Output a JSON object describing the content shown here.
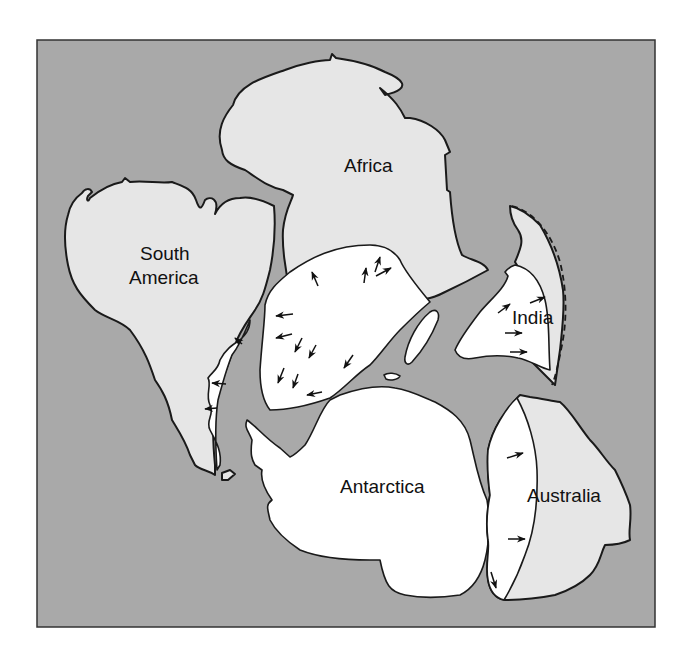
{
  "diagram": {
    "type": "paleogeographic-reconstruction-map",
    "colors": {
      "ocean": "#a9a9a9",
      "land": "#e6e6e6",
      "glaciated_area": "#ffffff",
      "outline": "#1a1a1a"
    },
    "labels": {
      "africa": "Africa",
      "south_america_line1": "South",
      "south_america_line2": "America",
      "india": "India",
      "antarctica": "Antarctica",
      "australia": "Australia"
    },
    "legend_notes": {
      "arrows": "ice-flow-direction",
      "white_area": "glaciated-region",
      "dashed_line": "uncertain-boundary"
    }
  }
}
